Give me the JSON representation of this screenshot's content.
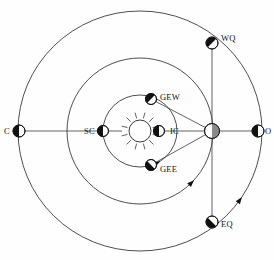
{
  "figure": {
    "type": "orbital-configuration-diagram",
    "background_color": "#fefefe",
    "stroke_color": "#3a3a3a",
    "marker_dark": "#111111",
    "marker_light": "#ffffff",
    "earth_fill": "#8a8a8a",
    "width": 274,
    "height": 260
  },
  "center": {
    "x": 140,
    "y": 131
  },
  "sun": {
    "name": "sun-symbol",
    "cx": 140,
    "cy": 131,
    "r": 11,
    "ray_count": 12,
    "ray_inner": 13,
    "ray_outer": 19
  },
  "orbits": [
    {
      "name": "inner-orbit",
      "label": "inferior planet orbit",
      "rx": 37,
      "ry": 36,
      "arrow_angle_deg": 118
    },
    {
      "name": "middle-orbit",
      "label": "earth orbit",
      "rx": 73,
      "ry": 73,
      "arrow_angle_deg": 135
    },
    {
      "name": "outer-orbit",
      "label": "superior planet orbit",
      "rx": 122,
      "ry": 120,
      "arrow_angle_deg": 145
    }
  ],
  "lines": [
    {
      "name": "horizontal-axis-line",
      "x1": 19,
      "y1": 131,
      "x2": 258,
      "y2": 131
    },
    {
      "name": "quadrature-vertical-line",
      "x1": 212,
      "y1": 43,
      "x2": 212,
      "y2": 222
    },
    {
      "name": "sight-line-to-gew",
      "x1": 212,
      "y1": 131,
      "x2": 151,
      "y2": 99
    },
    {
      "name": "sight-line-to-gee",
      "x1": 212,
      "y1": 131,
      "x2": 151,
      "y2": 165
    }
  ],
  "markers": [
    {
      "name": "marker-conjunction",
      "code": "C",
      "cx": 19,
      "cy": 131,
      "r": 6.0,
      "dark_side": "left",
      "label_x": 4,
      "label_y": 126,
      "label_align": "left"
    },
    {
      "name": "marker-superior-conjunction",
      "code": "SC",
      "cx": 103,
      "cy": 131,
      "r": 5.5,
      "dark_side": "left",
      "label_x": 84,
      "label_y": 126,
      "label_align": "left"
    },
    {
      "name": "marker-inferior-conjunction",
      "code": "IC",
      "cx": 159,
      "cy": 131,
      "r": 5.5,
      "dark_side": "left",
      "label_x": 170,
      "label_y": 126,
      "label_align": "left"
    },
    {
      "name": "marker-greatest-elongation-west",
      "code": "GEW",
      "cx": 151,
      "cy": 99,
      "r": 5.5,
      "dark_side": "upper-left",
      "label_x": 160,
      "label_y": 92,
      "label_align": "left"
    },
    {
      "name": "marker-greatest-elongation-east",
      "code": "GEE",
      "cx": 151,
      "cy": 165,
      "r": 5.5,
      "dark_side": "lower-left",
      "label_x": 160,
      "label_y": 164,
      "label_align": "left"
    },
    {
      "name": "marker-earth",
      "code": "",
      "cx": 212,
      "cy": 131,
      "r": 7.5,
      "dark_side": "earth",
      "label_x": 0,
      "label_y": 0,
      "label_align": "left"
    },
    {
      "name": "marker-opposition",
      "code": "O",
      "cx": 258,
      "cy": 131,
      "r": 6.0,
      "dark_side": "left",
      "label_x": 265,
      "label_y": 126,
      "label_align": "left"
    },
    {
      "name": "marker-western-quadrature",
      "code": "WQ",
      "cx": 212,
      "cy": 43,
      "r": 6.0,
      "dark_side": "upper-left",
      "label_x": 221,
      "label_y": 33,
      "label_align": "left"
    },
    {
      "name": "marker-eastern-quadrature",
      "code": "EQ",
      "cx": 212,
      "cy": 222,
      "r": 6.0,
      "dark_side": "lower-left",
      "label_x": 221,
      "label_y": 219,
      "label_align": "left"
    }
  ],
  "legend_terms": {
    "C": "Conjunction",
    "O": "Opposition",
    "SC": "Superior Conjunction",
    "IC": "Inferior Conjunction",
    "GEW": "Greatest Elongation West",
    "GEE": "Greatest Elongation East",
    "WQ": "Western Quadrature",
    "EQ": "Eastern Quadrature"
  }
}
